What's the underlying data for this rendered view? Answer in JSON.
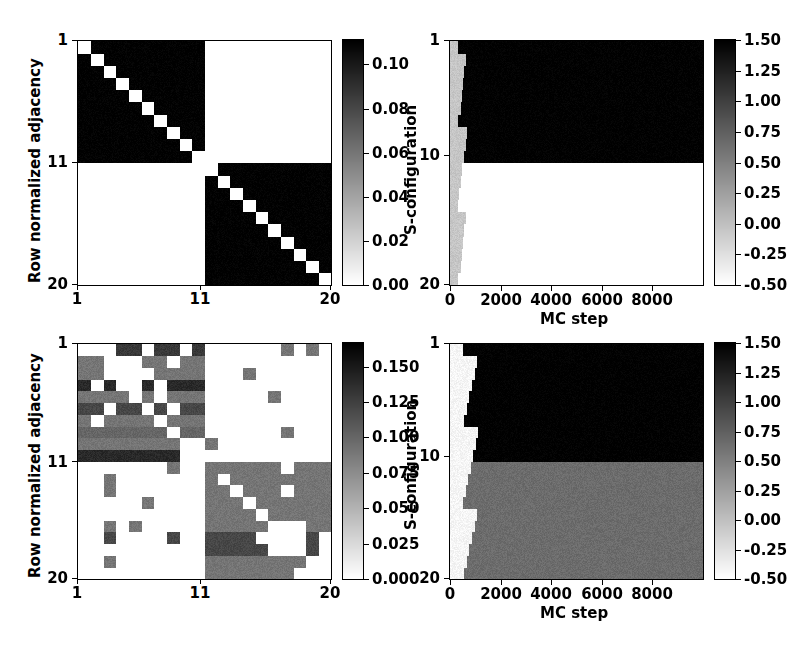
{
  "figure": {
    "width": 805,
    "height": 659,
    "background": "#ffffff",
    "panel_count": 4
  },
  "chart_data": [
    {
      "id": "top-left",
      "type": "heatmap",
      "title": "",
      "xlabel": "",
      "ylabel": "Row normalized adjacency",
      "xticks": [
        "1",
        "11",
        "20"
      ],
      "xtick_values": [
        1,
        11,
        20
      ],
      "yticks": [
        "1",
        "11",
        "20"
      ],
      "ytick_values": [
        1,
        11,
        20
      ],
      "xlim": [
        1,
        20
      ],
      "ylim": [
        20,
        1
      ],
      "grid": false,
      "cmap": "gray_r",
      "rows": 20,
      "cols": 20,
      "vmin": 0.0,
      "vmax": 0.1111,
      "colorbar": {
        "position": "right",
        "ticks": [
          "0.00",
          "0.02",
          "0.04",
          "0.06",
          "0.08",
          "0.10"
        ],
        "tick_values": [
          0.0,
          0.02,
          0.04,
          0.06,
          0.08,
          0.1
        ],
        "vmin": 0.0,
        "vmax": 0.1111
      },
      "description": "Block diagonal adjacency: two 10x10 communities, uniform 1/9 off-diagonal within block, zero on diagonal and between blocks",
      "block_value": 0.1111,
      "zero_value": 0.0,
      "blocks": [
        [
          0,
          9
        ],
        [
          10,
          19
        ]
      ]
    },
    {
      "id": "top-right",
      "type": "heatmap",
      "title": "",
      "xlabel": "MC step",
      "ylabel": "S-configuration",
      "xticks": [
        "0",
        "2000",
        "4000",
        "6000",
        "8000"
      ],
      "xtick_values": [
        0,
        2000,
        4000,
        6000,
        8000
      ],
      "yticks": [
        "1",
        "10",
        "20"
      ],
      "ytick_values": [
        1,
        10,
        20
      ],
      "xlim": [
        0,
        10000
      ],
      "ylim": [
        20,
        1
      ],
      "grid": false,
      "cmap": "gray_r",
      "rows": 20,
      "cols": 200,
      "vmin": -0.5,
      "vmax": 1.5,
      "colorbar": {
        "position": "right",
        "ticks": [
          "-0.50",
          "-0.25",
          "0.00",
          "0.25",
          "0.50",
          "0.75",
          "1.00",
          "1.25",
          "1.50"
        ],
        "tick_values": [
          -0.5,
          -0.25,
          0.0,
          0.25,
          0.5,
          0.75,
          1.0,
          1.25,
          1.5
        ],
        "vmin": -0.5,
        "vmax": 1.5
      },
      "description": "Spin configuration trajectory: short light transient near step 0 then rows 1-10 lock to +1 (dark) and rows 11-20 stay at -1 (white)",
      "transient_end_step": 520,
      "transient_value": -0.05,
      "segments": [
        {
          "row_start": 0,
          "row_end": 9,
          "value": 1.5
        },
        {
          "row_start": 10,
          "row_end": 19,
          "value": -0.5
        }
      ]
    },
    {
      "id": "bottom-left",
      "type": "heatmap",
      "title": "",
      "xlabel": "",
      "ylabel": "Row normalized adjacency",
      "xticks": [
        "1",
        "11",
        "20"
      ],
      "xtick_values": [
        1,
        11,
        20
      ],
      "yticks": [
        "1",
        "11",
        "20"
      ],
      "ytick_values": [
        1,
        11,
        20
      ],
      "xlim": [
        1,
        20
      ],
      "ylim": [
        20,
        1
      ],
      "grid": false,
      "cmap": "gray_r",
      "rows": 20,
      "cols": 20,
      "vmin": 0.0,
      "vmax": 0.1667,
      "colorbar": {
        "position": "right",
        "ticks": [
          "0.000",
          "0.025",
          "0.050",
          "0.075",
          "0.100",
          "0.125",
          "0.150"
        ],
        "tick_values": [
          0.0,
          0.025,
          0.05,
          0.075,
          0.1,
          0.125,
          0.15
        ],
        "vmin": 0.0,
        "vmax": 0.1667
      },
      "description": "Noisy two-community row normalized adjacency with sparse inter-community links",
      "matrix": [
        [
          0.0,
          0.0,
          0.0,
          0.13,
          0.13,
          0.0,
          0.13,
          0.13,
          0.0,
          0.13,
          0.0,
          0.0,
          0.0,
          0.0,
          0.0,
          0.0,
          0.09,
          0.0,
          0.09,
          0.0
        ],
        [
          0.09,
          0.09,
          0.0,
          0.0,
          0.0,
          0.09,
          0.09,
          0.0,
          0.09,
          0.09,
          0.0,
          0.0,
          0.0,
          0.0,
          0.0,
          0.0,
          0.0,
          0.0,
          0.0,
          0.0
        ],
        [
          0.09,
          0.09,
          0.0,
          0.0,
          0.0,
          0.0,
          0.09,
          0.09,
          0.09,
          0.09,
          0.0,
          0.0,
          0.0,
          0.09,
          0.0,
          0.0,
          0.0,
          0.0,
          0.0,
          0.0
        ],
        [
          0.14,
          0.0,
          0.14,
          0.0,
          0.0,
          0.14,
          0.0,
          0.14,
          0.14,
          0.14,
          0.0,
          0.0,
          0.0,
          0.0,
          0.0,
          0.0,
          0.0,
          0.0,
          0.0,
          0.0
        ],
        [
          0.09,
          0.09,
          0.09,
          0.09,
          0.0,
          0.09,
          0.0,
          0.09,
          0.09,
          0.09,
          0.0,
          0.0,
          0.0,
          0.0,
          0.0,
          0.09,
          0.0,
          0.0,
          0.0,
          0.0
        ],
        [
          0.12,
          0.12,
          0.0,
          0.12,
          0.12,
          0.0,
          0.12,
          0.0,
          0.12,
          0.12,
          0.0,
          0.0,
          0.0,
          0.0,
          0.0,
          0.0,
          0.0,
          0.0,
          0.0,
          0.0
        ],
        [
          0.09,
          0.0,
          0.09,
          0.09,
          0.09,
          0.09,
          0.0,
          0.09,
          0.09,
          0.09,
          0.0,
          0.0,
          0.0,
          0.0,
          0.0,
          0.0,
          0.0,
          0.0,
          0.0,
          0.0
        ],
        [
          0.1,
          0.1,
          0.1,
          0.1,
          0.1,
          0.1,
          0.1,
          0.0,
          0.1,
          0.1,
          0.0,
          0.0,
          0.0,
          0.0,
          0.0,
          0.0,
          0.09,
          0.0,
          0.0,
          0.0
        ],
        [
          0.09,
          0.09,
          0.09,
          0.09,
          0.09,
          0.09,
          0.09,
          0.09,
          0.0,
          0.0,
          0.09,
          0.0,
          0.0,
          0.0,
          0.0,
          0.0,
          0.0,
          0.0,
          0.0,
          0.0
        ],
        [
          0.14,
          0.14,
          0.14,
          0.14,
          0.14,
          0.14,
          0.14,
          0.14,
          0.0,
          0.0,
          0.0,
          0.0,
          0.0,
          0.0,
          0.0,
          0.0,
          0.0,
          0.0,
          0.0,
          0.0
        ],
        [
          0.0,
          0.0,
          0.0,
          0.0,
          0.0,
          0.0,
          0.0,
          0.09,
          0.0,
          0.0,
          0.09,
          0.09,
          0.09,
          0.09,
          0.09,
          0.09,
          0.0,
          0.09,
          0.09,
          0.09
        ],
        [
          0.0,
          0.0,
          0.09,
          0.0,
          0.0,
          0.0,
          0.0,
          0.0,
          0.0,
          0.0,
          0.09,
          0.0,
          0.09,
          0.09,
          0.09,
          0.09,
          0.09,
          0.09,
          0.09,
          0.09
        ],
        [
          0.0,
          0.0,
          0.09,
          0.0,
          0.0,
          0.0,
          0.0,
          0.0,
          0.0,
          0.0,
          0.09,
          0.09,
          0.0,
          0.09,
          0.09,
          0.09,
          0.0,
          0.09,
          0.09,
          0.09
        ],
        [
          0.0,
          0.0,
          0.0,
          0.0,
          0.0,
          0.09,
          0.0,
          0.0,
          0.0,
          0.0,
          0.09,
          0.09,
          0.09,
          0.0,
          0.09,
          0.09,
          0.09,
          0.09,
          0.09,
          0.09
        ],
        [
          0.0,
          0.0,
          0.0,
          0.0,
          0.0,
          0.0,
          0.0,
          0.0,
          0.0,
          0.0,
          0.09,
          0.09,
          0.09,
          0.09,
          0.0,
          0.09,
          0.09,
          0.09,
          0.09,
          0.09
        ],
        [
          0.0,
          0.0,
          0.09,
          0.0,
          0.09,
          0.0,
          0.0,
          0.0,
          0.0,
          0.0,
          0.09,
          0.09,
          0.09,
          0.09,
          0.09,
          0.0,
          0.0,
          0.0,
          0.09,
          0.09
        ],
        [
          0.0,
          0.0,
          0.12,
          0.0,
          0.0,
          0.0,
          0.0,
          0.12,
          0.0,
          0.0,
          0.12,
          0.12,
          0.12,
          0.12,
          0.0,
          0.0,
          0.0,
          0.0,
          0.12,
          0.0
        ],
        [
          0.0,
          0.0,
          0.0,
          0.0,
          0.0,
          0.0,
          0.0,
          0.0,
          0.0,
          0.0,
          0.12,
          0.12,
          0.12,
          0.12,
          0.12,
          0.0,
          0.0,
          0.0,
          0.12,
          0.0
        ],
        [
          0.0,
          0.0,
          0.09,
          0.0,
          0.0,
          0.0,
          0.0,
          0.0,
          0.0,
          0.0,
          0.09,
          0.09,
          0.09,
          0.09,
          0.09,
          0.09,
          0.09,
          0.09,
          0.0,
          0.0
        ],
        [
          0.0,
          0.0,
          0.0,
          0.0,
          0.0,
          0.0,
          0.0,
          0.0,
          0.0,
          0.0,
          0.09,
          0.09,
          0.09,
          0.09,
          0.09,
          0.09,
          0.09,
          0.0,
          0.0,
          0.0
        ]
      ]
    },
    {
      "id": "bottom-right",
      "type": "heatmap",
      "title": "",
      "xlabel": "MC step",
      "ylabel": "S-configuration",
      "xticks": [
        "0",
        "2000",
        "4000",
        "6000",
        "8000"
      ],
      "xtick_values": [
        0,
        2000,
        4000,
        6000,
        8000
      ],
      "yticks": [
        "1",
        "10",
        "20"
      ],
      "ytick_values": [
        1,
        10,
        20
      ],
      "xlim": [
        0,
        10000
      ],
      "ylim": [
        20,
        1
      ],
      "grid": false,
      "cmap": "gray_r",
      "rows": 20,
      "cols": 200,
      "vmin": -0.5,
      "vmax": 1.5,
      "colorbar": {
        "position": "right",
        "ticks": [
          "-0.50",
          "-0.25",
          "0.00",
          "0.25",
          "0.50",
          "0.75",
          "1.00",
          "1.25",
          "1.50"
        ],
        "tick_values": [
          -0.5,
          -0.25,
          0.0,
          0.25,
          0.5,
          0.75,
          1.0,
          1.25,
          1.5
        ],
        "vmin": -0.5,
        "vmax": 1.5
      },
      "description": "Spin configuration trajectory: light transient then rows 1-10 lock to 1.5 (dark) and rows 11-20 settle to an intermediate 0.65 gray",
      "transient_end_step": 900,
      "transient_value": -0.42,
      "segments": [
        {
          "row_start": 0,
          "row_end": 9,
          "value": 1.5
        },
        {
          "row_start": 10,
          "row_end": 19,
          "value": 0.65
        }
      ]
    }
  ],
  "labels": {
    "row_normalized_adjacency": "Row normalized adjacency",
    "s_configuration": "S-configuration",
    "mc_step": "MC step"
  },
  "colors": {
    "axis": "#000000",
    "background": "#ffffff",
    "cmap_low": "#ffffff",
    "cmap_high": "#000000"
  }
}
